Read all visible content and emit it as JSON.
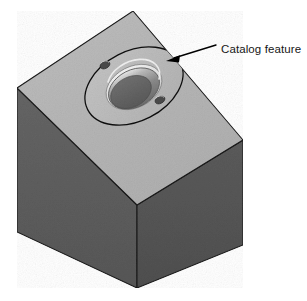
{
  "figure": {
    "background_color": "#ffffff",
    "annotation": {
      "label": "Catalog feature",
      "label_color": "#161616",
      "leader_color": "#000000",
      "arrow_name": "leader-arrow",
      "points_to": "outer boss ellipse on top face"
    },
    "solid": {
      "name": "rectangular block",
      "shape": "cube",
      "top_face_color": "#b5b5b5",
      "left_face_color": "#5e5e5e",
      "right_face_color": "#565656",
      "edge_color": "#1a1a1a",
      "vertices": {
        "top": "133,11",
        "left": "17,88",
        "right": "243,140",
        "front": "137,205",
        "bottom_left": "17,232",
        "bottom_front": "137,288",
        "bottom_right": "243,245"
      }
    },
    "feature": {
      "name": "catalog feature",
      "type": "counterbored boss with two fastener holes",
      "boss_outline_color": "#111111",
      "boss_face_color": "#bdbdbd",
      "counterbore_rim_color": "#e2e2e2",
      "bore_wall_color": "#8e8e8e",
      "bore_floor_color": "#646464",
      "hole_color": "#4a4a4a",
      "center": "134,86",
      "boss_radius_x": 52,
      "boss_radius_y": 35,
      "boss_rotation_deg": -27,
      "bore_radius_x": 28,
      "bore_radius_y": 19,
      "fastener_holes": [
        {
          "name": "fastener-hole-upper-left",
          "cx": 105,
          "cy": 65,
          "rx": 5,
          "ry": 3.4
        },
        {
          "name": "fastener-hole-lower-right",
          "cx": 160,
          "cy": 100,
          "rx": 5,
          "ry": 3.4
        }
      ]
    }
  }
}
